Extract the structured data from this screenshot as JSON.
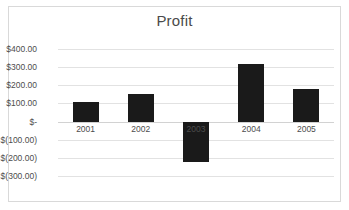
{
  "chart_data": {
    "type": "bar",
    "title": "Profit",
    "xlabel": "",
    "ylabel": "",
    "categories": [
      "2001",
      "2002",
      "2003",
      "2004",
      "2005"
    ],
    "values": [
      110,
      150,
      -225,
      315,
      180
    ],
    "series": [
      {
        "name": "Profit",
        "values": [
          110,
          150,
          -225,
          315,
          180
        ]
      }
    ],
    "ylim": [
      -300,
      400
    ],
    "ytick_values": [
      400,
      300,
      200,
      100,
      0,
      -100,
      -200,
      -300
    ],
    "ytick_labels": [
      "$400.00",
      "$300.00",
      "$200.00",
      "$100.00",
      "$-",
      "$(100.00)",
      "$(200.00)",
      "$(300.00)"
    ],
    "grid": true,
    "grid_axis": "y",
    "legend": false,
    "legend_position": "none",
    "bar_color": "#1a1a1a",
    "gridline_color": "#e2e2e2",
    "plot_background": "#ffffff",
    "border_color": "#d9d9d9",
    "text_color": "#4d4d4d",
    "title_color": "#4a4a4a",
    "annotations": []
  }
}
